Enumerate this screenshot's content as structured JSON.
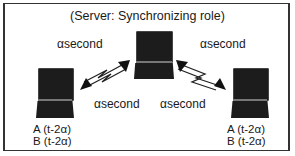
{
  "title": "(Server: Synchronizing role)",
  "links": {
    "top_left": "αsecond",
    "top_right": "αsecond",
    "bottom_left": "αsecond",
    "bottom_right": "αsecond"
  },
  "nodes": {
    "server": {
      "role": "server"
    },
    "left": {
      "lines": [
        "A (t-2α)",
        "B (t-2α)"
      ]
    },
    "right": {
      "lines": [
        "A (t-2α)",
        "B (t-2α)"
      ]
    }
  }
}
